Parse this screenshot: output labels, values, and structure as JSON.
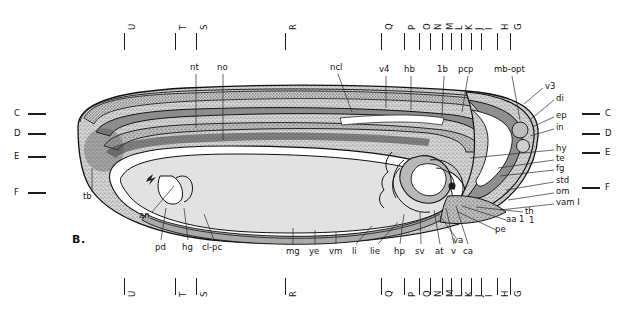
{
  "figure": {
    "panel_label": "B."
  },
  "colors": {
    "outline": "#111111",
    "ectoderm_fill": "#c9c9c9",
    "neural_tube_fill": "#8d8d8d",
    "notochord_fill": "#6f6f6f",
    "yolk_fill": "#e2e2e2",
    "gut_fill": "#b4b4b4",
    "heart_fill": "#9a9a9a",
    "cavity_fill": "#ffffff",
    "label_text": "#151515"
  },
  "section_markers_top": [
    {
      "letter": "U",
      "x": 124
    },
    {
      "letter": "T",
      "x": 175
    },
    {
      "letter": "S",
      "x": 196
    },
    {
      "letter": "R",
      "x": 285
    },
    {
      "letter": "Q",
      "x": 381
    },
    {
      "letter": "P",
      "x": 404
    },
    {
      "letter": "O",
      "x": 419
    },
    {
      "letter": "N",
      "x": 430
    },
    {
      "letter": "M",
      "x": 442
    },
    {
      "letter": "L",
      "x": 451
    },
    {
      "letter": "K",
      "x": 461
    },
    {
      "letter": "J",
      "x": 471
    },
    {
      "letter": "I",
      "x": 481
    },
    {
      "letter": "H",
      "x": 497
    },
    {
      "letter": "G",
      "x": 510
    }
  ],
  "section_markers_bottom": [
    {
      "letter": "U",
      "x": 124
    },
    {
      "letter": "T",
      "x": 175
    },
    {
      "letter": "S",
      "x": 196
    },
    {
      "letter": "R",
      "x": 285
    },
    {
      "letter": "Q",
      "x": 381
    },
    {
      "letter": "P",
      "x": 404
    },
    {
      "letter": "O",
      "x": 419
    },
    {
      "letter": "N",
      "x": 430
    },
    {
      "letter": "M",
      "x": 442
    },
    {
      "letter": "L",
      "x": 451
    },
    {
      "letter": "K",
      "x": 461
    },
    {
      "letter": "J",
      "x": 471
    },
    {
      "letter": "I",
      "x": 481
    },
    {
      "letter": "H",
      "x": 497
    },
    {
      "letter": "G",
      "x": 510
    }
  ],
  "level_markers_left": [
    {
      "letter": "C",
      "y": 113
    },
    {
      "letter": "D",
      "y": 133
    },
    {
      "letter": "E",
      "y": 156
    },
    {
      "letter": "F",
      "y": 192
    }
  ],
  "level_markers_right": [
    {
      "letter": "C",
      "y": 113
    },
    {
      "letter": "D",
      "y": 133
    },
    {
      "letter": "E",
      "y": 152
    },
    {
      "letter": "F",
      "y": 187
    }
  ],
  "labels_top": [
    {
      "text": "nt",
      "x": 190,
      "y": 68
    },
    {
      "text": "no",
      "x": 218,
      "y": 68
    },
    {
      "text": "ncl",
      "x": 331,
      "y": 68
    },
    {
      "text": "v4",
      "x": 381,
      "y": 70
    },
    {
      "text": "hb",
      "x": 406,
      "y": 70
    },
    {
      "text": "1b",
      "x": 440,
      "y": 70
    },
    {
      "text": "pcp",
      "x": 461,
      "y": 70
    },
    {
      "text": "mb-opt",
      "x": 497,
      "y": 70
    }
  ],
  "labels_right": [
    {
      "text": "v3",
      "x": 545,
      "y": 86
    },
    {
      "text": "di",
      "x": 556,
      "y": 98
    },
    {
      "text": "ep",
      "x": 556,
      "y": 115
    },
    {
      "text": "in",
      "x": 556,
      "y": 127
    },
    {
      "text": "hy",
      "x": 556,
      "y": 148
    },
    {
      "text": "te",
      "x": 556,
      "y": 158
    },
    {
      "text": "fg",
      "x": 556,
      "y": 168
    },
    {
      "text": "std",
      "x": 556,
      "y": 180
    },
    {
      "text": "om",
      "x": 556,
      "y": 191
    },
    {
      "text": "vam I",
      "x": 556,
      "y": 202
    },
    {
      "text": "th",
      "x": 525,
      "y": 211
    },
    {
      "text": "aa 1",
      "x": 508,
      "y": 219
    },
    {
      "text": "pe",
      "x": 497,
      "y": 229
    },
    {
      "text": "va",
      "x": 455,
      "y": 240
    }
  ],
  "labels_left": [
    {
      "text": "tb",
      "x": 83,
      "y": 196
    },
    {
      "text": "an",
      "x": 140,
      "y": 215
    }
  ],
  "labels_bottom": [
    {
      "text": "pd",
      "x": 157,
      "y": 247
    },
    {
      "text": "hg",
      "x": 184,
      "y": 247
    },
    {
      "text": "cl-pc",
      "x": 205,
      "y": 247
    },
    {
      "text": "mg",
      "x": 288,
      "y": 251
    },
    {
      "text": "ye",
      "x": 311,
      "y": 251
    },
    {
      "text": "vm",
      "x": 331,
      "y": 251
    },
    {
      "text": "li",
      "x": 352,
      "y": 251
    },
    {
      "text": "lie",
      "x": 372,
      "y": 251
    },
    {
      "text": "hp",
      "x": 396,
      "y": 251
    },
    {
      "text": "sv",
      "x": 417,
      "y": 251
    },
    {
      "text": "at",
      "x": 437,
      "y": 251
    },
    {
      "text": "v",
      "x": 452,
      "y": 251
    },
    {
      "text": "ca",
      "x": 465,
      "y": 251
    }
  ],
  "extra_marks": [
    {
      "text": "1",
      "x": 529,
      "y": 220
    }
  ]
}
